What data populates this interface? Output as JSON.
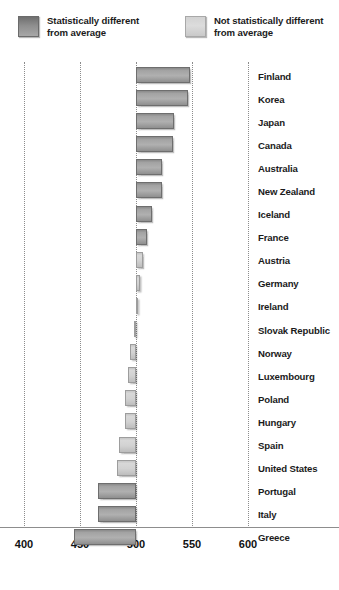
{
  "legend": {
    "items": [
      {
        "id": "statistically-different",
        "label": "Statistically different\nfrom average",
        "style": "dark",
        "color": "#8e8e8e"
      },
      {
        "id": "not-statistically-different",
        "label": "Not statistically different\nfrom average",
        "style": "light",
        "color": "#d6d6d6"
      }
    ]
  },
  "chart_data": {
    "type": "bar",
    "orientation": "horizontal",
    "title": "",
    "subtitle": "",
    "xlabel": "",
    "ylabel": "",
    "xlim": [
      400,
      600
    ],
    "baseline": 500,
    "grid": true,
    "gridlines": [
      400,
      450,
      500,
      550,
      600
    ],
    "xticks": [
      "400",
      "450",
      "500",
      "550",
      "600"
    ],
    "legend_position": "top",
    "categories": [
      "Finland",
      "Korea",
      "Japan",
      "Canada",
      "Australia",
      "New Zealand",
      "Iceland",
      "France",
      "Austria",
      "Germany",
      "Ireland",
      "Slovak Republic",
      "Norway",
      "Luxembourg",
      "Poland",
      "Hungary",
      "Spain",
      "United States",
      "Portugal",
      "Italy",
      "Greece"
    ],
    "values": [
      548,
      546,
      534,
      533,
      523,
      523,
      514,
      510,
      506,
      504,
      502,
      498,
      495,
      493,
      490,
      490,
      485,
      483,
      466,
      466,
      445
    ],
    "significance": [
      "different",
      "different",
      "different",
      "different",
      "different",
      "different",
      "different",
      "different",
      "same",
      "same",
      "same",
      "same",
      "same",
      "same",
      "same",
      "same",
      "same",
      "same",
      "different",
      "different",
      "different"
    ]
  }
}
